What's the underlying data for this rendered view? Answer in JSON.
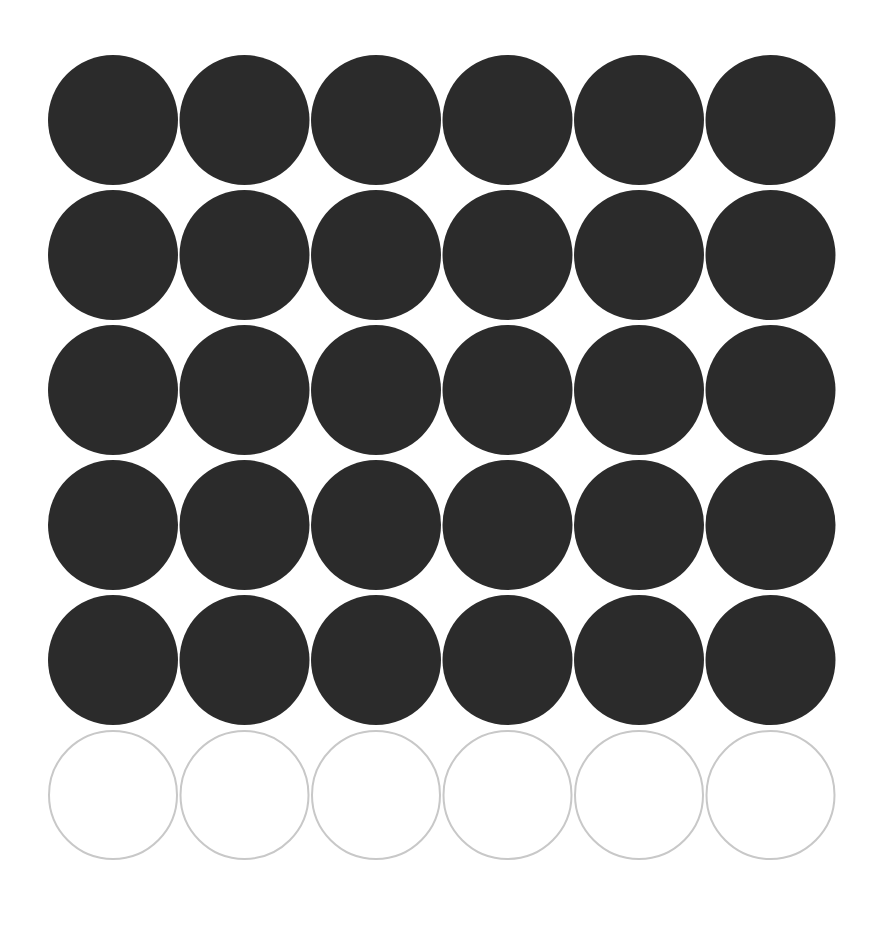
{
  "grid": {
    "columns": 6,
    "rows": 6,
    "filled_rows": 5,
    "empty_rows": 1,
    "filled_count": 30,
    "empty_count": 6,
    "total_count": 36,
    "origin_x": 113,
    "origin_y": 120,
    "spacing_x": 131.5,
    "spacing_y": 135,
    "radius": 65
  },
  "colors": {
    "background": "#ffffff",
    "filled": "#2b2b2b",
    "outline_stroke": "#c8c8c8"
  }
}
